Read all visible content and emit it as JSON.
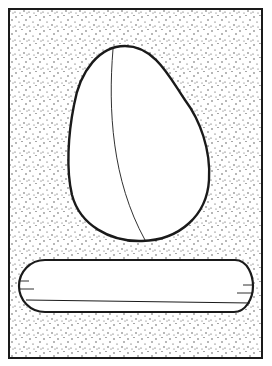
{
  "figure": {
    "title": "",
    "width": 272,
    "height": 366,
    "colors": {
      "background": "#ffffff",
      "ink": "#1a1a1a",
      "stipple": "#3a3a3a",
      "shape_fill": "#ffffff"
    },
    "elements": [
      {
        "name": "stippled-frame",
        "type": "rectangle",
        "x": 9,
        "y": 9,
        "w": 253,
        "h": 349,
        "fill": "stipple"
      },
      {
        "name": "egg-shape",
        "type": "closed-curve",
        "fill": "white",
        "inner_curve": true
      },
      {
        "name": "rounded-bar",
        "type": "capsule",
        "x": 20,
        "y": 260,
        "w": 232,
        "h": 52,
        "inner_line": true,
        "end_ticks": 2
      }
    ]
  }
}
